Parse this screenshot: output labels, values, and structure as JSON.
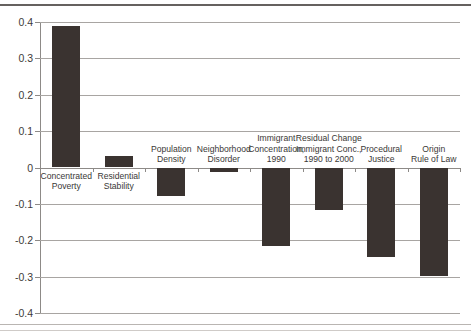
{
  "chart_data": {
    "type": "bar",
    "title": "",
    "xlabel": "",
    "ylabel": "",
    "ylim": [
      -0.4,
      0.4
    ],
    "ytick_labels": [
      "0.4",
      "0.3",
      "0.2",
      "0.1",
      "0",
      "-0.1",
      "-0.2",
      "-0.3",
      "-0.4"
    ],
    "ytick_values": [
      0.4,
      0.3,
      0.2,
      0.1,
      0,
      -0.1,
      -0.2,
      -0.3,
      -0.4
    ],
    "grid": true,
    "legend": "none",
    "bar_color": "#3a3330",
    "categories": [
      "Concentrated Poverty",
      "Residential Stability",
      "Population Density",
      "Neighborhood Disorder",
      "Immigrant Concentration, 1990",
      "Residual Change Immigrant Conc., 1990 to 2000",
      "Procedural Justice",
      "Origin Rule of Law"
    ],
    "category_label_lines": [
      [
        "Concentrated",
        "Poverty"
      ],
      [
        "Residential",
        "Stability"
      ],
      [
        "Population",
        "Density"
      ],
      [
        "Neighborhood",
        "Disorder"
      ],
      [
        "Immigrant",
        "Concentration,",
        "1990"
      ],
      [
        "Residual Change",
        "Immigrant Conc.,",
        "1990 to 2000"
      ],
      [
        "Procedural",
        "Justice"
      ],
      [
        "Origin",
        "Rule of Law"
      ]
    ],
    "values": [
      0.389,
      0.031,
      -0.078,
      -0.013,
      -0.215,
      -0.118,
      -0.245,
      -0.297
    ]
  }
}
